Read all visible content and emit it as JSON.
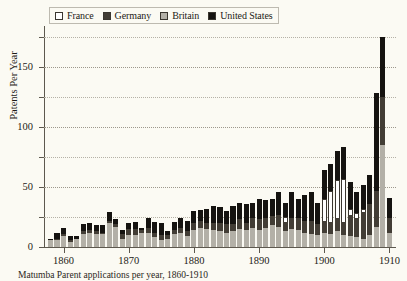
{
  "figure": {
    "background_color": "#fbfaf3",
    "caption_partial": "Matumba Parent applications per year, 1860-1910"
  },
  "legend": {
    "position": "top-left-inside",
    "items": [
      {
        "label": "France",
        "color": "#ffffff",
        "key": "FR"
      },
      {
        "label": "Germany",
        "color": "#423d35",
        "key": "DE"
      },
      {
        "label": "Britain",
        "color": "#b3b0a7",
        "key": "GB"
      },
      {
        "label": "United States",
        "color": "#151310",
        "key": "US"
      }
    ]
  },
  "axes": {
    "y_title": "Patents Per Year",
    "y_ticks": [
      0,
      50,
      100,
      150
    ],
    "y_minor_ticks": [
      25,
      75,
      125,
      175
    ],
    "y_range": [
      0,
      180
    ],
    "x_ticks": [
      1860,
      1870,
      1880,
      1890,
      1900,
      1910
    ],
    "x_range": [
      1857,
      1911
    ]
  },
  "chart_data": {
    "type": "bar",
    "subtype": "stacked",
    "title": "",
    "xlabel": "",
    "ylabel": "Patents Per Year",
    "ylim": [
      0,
      180
    ],
    "xlim": [
      1857,
      1911
    ],
    "grid": true,
    "legend_position": "upper left",
    "categories": [
      1858,
      1859,
      1860,
      1861,
      1862,
      1863,
      1864,
      1865,
      1866,
      1867,
      1868,
      1869,
      1870,
      1871,
      1872,
      1873,
      1874,
      1875,
      1876,
      1877,
      1878,
      1879,
      1880,
      1881,
      1882,
      1883,
      1884,
      1885,
      1886,
      1887,
      1888,
      1889,
      1890,
      1891,
      1892,
      1893,
      1894,
      1895,
      1896,
      1897,
      1898,
      1899,
      1900,
      1901,
      1902,
      1903,
      1904,
      1905,
      1906,
      1907,
      1908,
      1909,
      1910
    ],
    "series": [
      {
        "name": "France",
        "color": "#ffffff",
        "values": [
          0,
          0,
          0,
          0,
          0,
          0,
          0,
          0,
          0,
          0,
          0,
          0,
          0,
          0,
          0,
          0,
          0,
          0,
          0,
          0,
          0,
          0,
          0,
          0,
          0,
          0,
          0,
          0,
          0,
          0,
          0,
          0,
          0,
          0,
          0,
          0,
          4,
          0,
          0,
          0,
          0,
          0,
          18,
          26,
          32,
          36,
          5,
          4,
          3,
          0,
          0,
          0,
          0
        ]
      },
      {
        "name": "Germany",
        "color": "#423d35",
        "values": [
          0,
          1,
          2,
          2,
          0,
          2,
          2,
          2,
          1,
          2,
          2,
          4,
          5,
          5,
          2,
          4,
          4,
          4,
          3,
          3,
          4,
          4,
          6,
          6,
          5,
          6,
          7,
          7,
          6,
          8,
          6,
          8,
          9,
          8,
          8,
          10,
          8,
          9,
          10,
          10,
          11,
          9,
          10,
          10,
          11,
          11,
          18,
          16,
          22,
          26,
          30,
          40,
          12
        ]
      },
      {
        "name": "Britain",
        "color": "#b3b0a7",
        "values": [
          6,
          6,
          9,
          4,
          7,
          11,
          12,
          11,
          11,
          20,
          17,
          7,
          10,
          10,
          12,
          12,
          8,
          6,
          7,
          11,
          12,
          9,
          14,
          16,
          15,
          14,
          13,
          12,
          13,
          15,
          14,
          16,
          14,
          16,
          18,
          17,
          13,
          15,
          14,
          12,
          11,
          10,
          12,
          11,
          13,
          10,
          9,
          8,
          7,
          10,
          17,
          85,
          12
        ]
      },
      {
        "name": "United States",
        "color": "#151310",
        "values": [
          1,
          5,
          5,
          3,
          2,
          6,
          6,
          5,
          6,
          7,
          4,
          3,
          5,
          6,
          2,
          8,
          9,
          10,
          3,
          7,
          8,
          9,
          10,
          9,
          12,
          14,
          13,
          11,
          15,
          14,
          16,
          13,
          17,
          15,
          14,
          19,
          12,
          22,
          16,
          21,
          24,
          18,
          24,
          22,
          24,
          26,
          22,
          18,
          20,
          24,
          81,
          50,
          17
        ]
      }
    ]
  }
}
